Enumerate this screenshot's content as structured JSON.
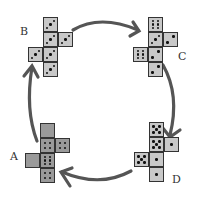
{
  "colors": {
    "face_light": "#c8c8c8",
    "face_dark": "#9a9a9a",
    "arrow": "#555555",
    "border": "#333333"
  },
  "arrows": [
    {
      "from": "B",
      "to": "C",
      "direction": "clockwise"
    },
    {
      "from": "C",
      "to": "D",
      "direction": "clockwise"
    },
    {
      "from": "D",
      "to": "A",
      "direction": "clockwise"
    },
    {
      "from": "A",
      "to": "B",
      "direction": "clockwise"
    }
  ],
  "nets": [
    {
      "label": "B",
      "shade": "light",
      "faces": [
        {
          "pos": "col-row1",
          "pips": 3
        },
        {
          "pos": "col-row2",
          "pips": 3
        },
        {
          "pos": "col-row3",
          "pips": 3
        },
        {
          "pos": "col-row4",
          "pips": 3
        },
        {
          "pos": "right-row2",
          "pips": 3
        },
        {
          "pos": "left-row3",
          "pips": 3
        }
      ]
    },
    {
      "label": "C",
      "shade": "light",
      "faces": [
        {
          "pos": "col-row1",
          "pips": 6
        },
        {
          "pos": "col-row2",
          "pips": 3
        },
        {
          "pos": "col-row3",
          "pips": 2
        },
        {
          "pos": "col-row4",
          "pips": 2
        },
        {
          "pos": "right-row2",
          "pips": 2
        },
        {
          "pos": "left-row3",
          "pips": 6
        }
      ]
    },
    {
      "label": "D",
      "shade": "light",
      "faces": [
        {
          "pos": "col-row1",
          "pips": 5
        },
        {
          "pos": "col-row2",
          "pips": 5
        },
        {
          "pos": "col-row3",
          "pips": 1
        },
        {
          "pos": "col-row4",
          "pips": 1
        },
        {
          "pos": "right-row2",
          "pips": 1
        },
        {
          "pos": "left-row3",
          "pips": 5
        }
      ]
    },
    {
      "label": "A",
      "shade": "dark",
      "faces": [
        {
          "pos": "col-row1",
          "pips": 0
        },
        {
          "pos": "col-row2",
          "pips": 4
        },
        {
          "pos": "col-row3",
          "pips": 6
        },
        {
          "pos": "col-row4",
          "pips": 4
        },
        {
          "pos": "right-row2",
          "pips": 4
        },
        {
          "pos": "left-row3",
          "pips": 0
        }
      ]
    }
  ]
}
